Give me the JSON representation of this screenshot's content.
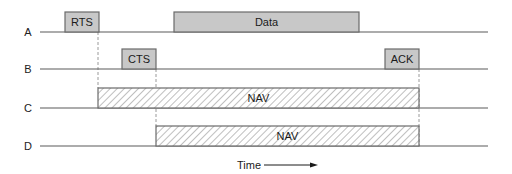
{
  "diagram": {
    "type": "timing-diagram",
    "title": "",
    "colors": {
      "line": "#5a5a5a",
      "box_fill": "#c8c8c8",
      "box_stroke": "#6a6a6a",
      "hatch": "#8a8a8a",
      "dashed": "#9a9a9a",
      "text": "#1a1a1a"
    },
    "rows": [
      {
        "id": "A",
        "label": "A",
        "baseline_y": 32
      },
      {
        "id": "B",
        "label": "B",
        "baseline_y": 69
      },
      {
        "id": "C",
        "label": "C",
        "baseline_y": 108
      },
      {
        "id": "D",
        "label": "D",
        "baseline_y": 146
      }
    ],
    "frames": [
      {
        "id": "rts",
        "row": "A",
        "label": "RTS",
        "x1": 65,
        "x2": 99,
        "style": "solid"
      },
      {
        "id": "data",
        "row": "A",
        "label": "Data",
        "x1": 174,
        "x2": 359,
        "style": "solid"
      },
      {
        "id": "cts",
        "row": "B",
        "label": "CTS",
        "x1": 122,
        "x2": 156,
        "style": "solid"
      },
      {
        "id": "ack",
        "row": "B",
        "label": "ACK",
        "x1": 385,
        "x2": 419,
        "style": "solid"
      },
      {
        "id": "nav-c",
        "row": "C",
        "label": "NAV",
        "x1": 98,
        "x2": 419,
        "style": "hatched"
      },
      {
        "id": "nav-d",
        "row": "D",
        "label": "NAV",
        "x1": 156,
        "x2": 419,
        "style": "hatched"
      }
    ],
    "dashed_guides": [
      {
        "x": 98,
        "y1": 32,
        "y2": 88
      },
      {
        "x": 156,
        "y1": 69,
        "y2": 126
      },
      {
        "x": 419,
        "y1": 69,
        "y2": 146
      }
    ],
    "time_axis": {
      "label": "Time",
      "arrow_x1": 264,
      "arrow_x2": 318,
      "y": 165
    }
  }
}
